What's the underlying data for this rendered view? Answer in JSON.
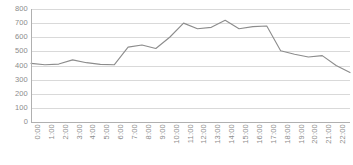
{
  "chart_data": {
    "type": "line",
    "title": "",
    "subtitle": "",
    "xlabel": "",
    "ylabel": "",
    "ylim": [
      0,
      800
    ],
    "ytick_step": 100,
    "yticks": [
      800,
      700,
      600,
      500,
      400,
      300,
      200,
      100,
      0
    ],
    "grid": true,
    "legend": false,
    "legend_position": "none",
    "line_color": "#8c8c8c",
    "grid_color": "#d9d9d9",
    "axis_color": "#b0b0b0",
    "label_color": "#8c8c8c",
    "categories": [
      "0:00",
      "1:00",
      "2:00",
      "3:00",
      "4:00",
      "5:00",
      "6:00",
      "7:00",
      "8:00",
      "9:00",
      "10:00",
      "11:00",
      "12:00",
      "13:00",
      "14:00",
      "15:00",
      "16:00",
      "17:00",
      "18:00",
      "19:00",
      "20:00",
      "21:00",
      "22:00",
      "23:00"
    ],
    "series": [
      {
        "name": "value",
        "values": [
          415,
          405,
          410,
          440,
          420,
          408,
          405,
          530,
          545,
          520,
          600,
          700,
          660,
          670,
          720,
          660,
          675,
          680,
          505,
          480,
          460,
          470,
          400,
          350
        ]
      }
    ]
  }
}
